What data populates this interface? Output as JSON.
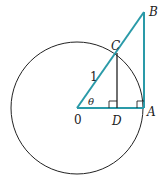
{
  "diagram": {
    "type": "unit-circle-trig",
    "colors": {
      "teal": "#2a9aa8",
      "black": "#222222"
    },
    "circle": {
      "cx": 77,
      "cy": 108,
      "r": 66
    },
    "points": {
      "O": {
        "label": "0",
        "x": 77,
        "y": 108
      },
      "A": {
        "label": "A",
        "x": 144,
        "y": 108
      },
      "B": {
        "label": "B",
        "x": 144,
        "y": 12
      },
      "C": {
        "label": "C",
        "x": 117,
        "y": 54
      },
      "D": {
        "label": "D",
        "x": 117,
        "y": 108
      }
    },
    "labels": {
      "radius": "1",
      "angle": "θ",
      "origin": "0",
      "A": "A",
      "B": "B",
      "C": "C",
      "D": "D"
    }
  }
}
